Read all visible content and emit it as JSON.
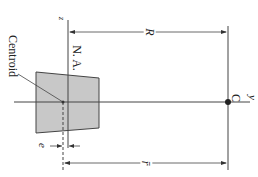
{
  "diagram": {
    "type": "curved-beam-cross-section",
    "orientation": "rotated 90 degrees clockwise",
    "labels": {
      "centroid": "Centroid",
      "neutral_axis": "N. A.",
      "z_axis": "z",
      "y_axis": "y",
      "center_point": "C",
      "radius_R": "R",
      "radius_r_bar": "r̄",
      "eccentricity": "e"
    },
    "colors": {
      "section_fill": "#c8c8c8",
      "line": "#333333",
      "background": "#ffffff"
    }
  }
}
